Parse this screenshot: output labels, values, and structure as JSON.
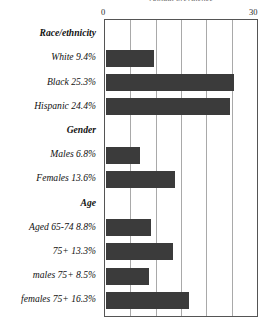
{
  "chart_data": {
    "type": "bar",
    "orientation": "horizontal",
    "title": "Annual prevalence",
    "xlabel": "",
    "ylabel": "",
    "xlim": [
      0,
      30
    ],
    "xticks": [
      0,
      30
    ],
    "xtick_labels": [
      "0",
      "30"
    ],
    "gridlines": [
      5,
      10,
      15,
      20,
      25
    ],
    "grid": true,
    "legend": false,
    "bar_color": "#3b3b3b",
    "groups": [
      {
        "name": "Race/ethnicity",
        "rows": [
          {
            "label": "White 9.4%",
            "value": 9.4
          },
          {
            "label": "Black 25.3%",
            "value": 25.3
          },
          {
            "label": "Hispanic 24.4%",
            "value": 24.4
          }
        ]
      },
      {
        "name": "Gender",
        "rows": [
          {
            "label": "Males 6.8%",
            "value": 6.8
          },
          {
            "label": "Females 13.6%",
            "value": 13.6
          }
        ]
      },
      {
        "name": "Age",
        "rows": [
          {
            "label": "Aged 65-74   8.8%",
            "value": 8.8
          },
          {
            "label": "75+   13.3%",
            "value": 13.3
          },
          {
            "label": "males 75+ 8.5%",
            "value": 8.5
          },
          {
            "label": "females 75+ 16.3%",
            "value": 16.3
          }
        ]
      }
    ],
    "categories": [
      "White",
      "Black",
      "Hispanic",
      "Males",
      "Females",
      "Aged 65-74",
      "75+",
      "males 75+",
      "females 75+"
    ],
    "values": [
      9.4,
      25.3,
      24.4,
      6.8,
      13.6,
      8.8,
      13.3,
      8.5,
      16.3
    ]
  },
  "axis": {
    "min_label": "0",
    "max_label": "30"
  }
}
